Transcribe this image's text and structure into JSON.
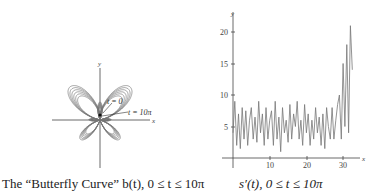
{
  "captions": {
    "left": "The “Butterfly Curve” b(t), 0 ≤ t ≤ 10π",
    "right": "s′(t), 0 ≤ t ≤ 10π"
  },
  "left_plot": {
    "x_axis_label": "x",
    "y_axis_label": "y",
    "annotations": [
      "t = 0",
      "t = 10π"
    ]
  },
  "right_plot": {
    "x_axis_label": "x",
    "y_axis_label": "y",
    "x_ticks": [
      "10",
      "20",
      "30"
    ],
    "y_ticks": [
      "5",
      "10",
      "15",
      "20"
    ]
  },
  "chart_data": [
    {
      "type": "line",
      "title": "The “Butterfly Curve” b(t), 0 ≤ t ≤ 10π",
      "description": "Parametric butterfly curve; two large upper wings, two smaller lower wings, nested loops",
      "xlabel": "x",
      "ylabel": "y",
      "annotations": [
        "t = 0",
        "t = 10π"
      ],
      "grid": false
    },
    {
      "type": "line",
      "title": "s′(t), 0 ≤ t ≤ 10π",
      "xlabel": "x",
      "ylabel": "y",
      "xlim": [
        0,
        32
      ],
      "ylim": [
        0,
        22
      ],
      "x_ticks": [
        10,
        20,
        30
      ],
      "y_ticks": [
        5,
        10,
        15,
        20
      ],
      "grid": false,
      "series": [
        {
          "name": "s'(t)",
          "x": [
            0,
            0.5,
            1,
            1.5,
            2,
            2.5,
            3,
            3.5,
            4,
            4.5,
            5,
            5.5,
            6,
            6.5,
            7,
            7.5,
            8,
            8.5,
            9,
            9.5,
            10,
            10.5,
            11,
            11.5,
            12,
            12.5,
            13,
            13.5,
            14,
            14.5,
            15,
            15.5,
            16,
            16.5,
            17,
            17.5,
            18,
            18.5,
            19,
            19.5,
            20,
            20.5,
            21,
            21.5,
            22,
            22.5,
            23,
            23.5,
            24,
            24.5,
            25,
            25.5,
            26,
            26.5,
            27,
            27.5,
            28,
            28.5,
            29,
            29.5,
            30,
            30.5,
            31,
            31.5,
            32,
            32.5
          ],
          "values": [
            4,
            9,
            2,
            7,
            1.5,
            8,
            3,
            7.5,
            2,
            6,
            8,
            3,
            6.5,
            2.5,
            9,
            4,
            7,
            2,
            8,
            3,
            6,
            7.5,
            2,
            9,
            3,
            6.5,
            1,
            8,
            4,
            6,
            2.5,
            8.5,
            3,
            7,
            5,
            9,
            3,
            6,
            2,
            8.5,
            4,
            7,
            2,
            6,
            3,
            8,
            4,
            6.5,
            2,
            7,
            1.5,
            8,
            5,
            3,
            8,
            3,
            6,
            8.5,
            10,
            3,
            15,
            5,
            18,
            4,
            21,
            14
          ]
        }
      ]
    }
  ]
}
